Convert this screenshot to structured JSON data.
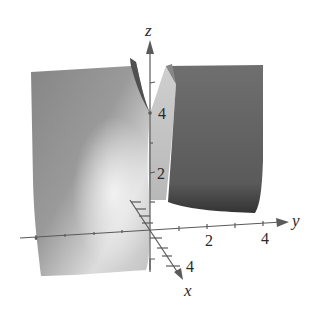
{
  "figure": {
    "axes": {
      "z": {
        "label": "z",
        "ticks": [
          "2",
          "4"
        ]
      },
      "y": {
        "label": "y",
        "ticks": [
          "2",
          "4"
        ]
      },
      "x": {
        "label": "x",
        "ticks": [
          "4"
        ]
      }
    },
    "colors": {
      "left_surface": "#8a8a8a",
      "left_surface_light": "#e8e8e8",
      "right_surface": "#6e6e6e",
      "right_surface_dark": "#3e3e3e",
      "axis": "#555555",
      "background": "#ffffff"
    }
  }
}
